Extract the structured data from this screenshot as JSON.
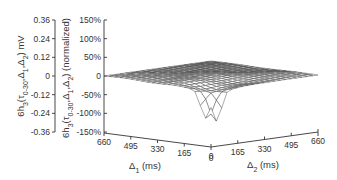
{
  "chart_data": {
    "type": "surface3d",
    "title": "",
    "left_axis": {
      "label": "6h3(τ0-30,Δ1,Δ2) mV",
      "ticks": [
        "0.36",
        "0.24",
        "0.12",
        "0",
        "-0.12",
        "-0.24",
        "-0.36"
      ],
      "range": [
        -0.36,
        0.36
      ]
    },
    "right_axis": {
      "label": "6h3(τ0-30,Δ1,Δ2) (normalized)",
      "ticks": [
        "150%",
        "100%",
        "50%",
        "0",
        "-50%",
        "-100%",
        "-150%"
      ],
      "range": [
        -150,
        150
      ]
    },
    "x_axis": {
      "label": "Δ1 (ms)",
      "ticks": [
        "660",
        "495",
        "330",
        "165",
        "0"
      ],
      "range": [
        0,
        660
      ]
    },
    "y_axis": {
      "label": "Δ2 (ms)",
      "ticks": [
        "0",
        "165",
        "330",
        "495",
        "660"
      ],
      "range": [
        0,
        660
      ]
    },
    "grid": false,
    "legend": null,
    "peaks": [
      {
        "delta1_ms": 40,
        "delta2_ms": 0,
        "normalized_percent": -130
      },
      {
        "delta1_ms": 0,
        "delta2_ms": 40,
        "normalized_percent": -148
      }
    ]
  },
  "labels": {
    "left_axis_label_main": "6h",
    "left_axis_label_sub": "3",
    "left_axis_label_rest": "(τ",
    "left_axis_label_tau_sub": "0-30",
    "left_axis_label_args": ",Δ",
    "left_axis_label_d1sub": "1",
    "left_axis_label_comma": ",Δ",
    "left_axis_label_d2sub": "2",
    "left_axis_label_unit": ") mV",
    "right_axis_label_unit": ") (normalized)",
    "x_axis_label": "Δ",
    "x_axis_sub": "1",
    "x_axis_unit": " (ms)",
    "y_axis_label": "Δ",
    "y_axis_sub": "2",
    "y_axis_unit": " (ms)"
  }
}
